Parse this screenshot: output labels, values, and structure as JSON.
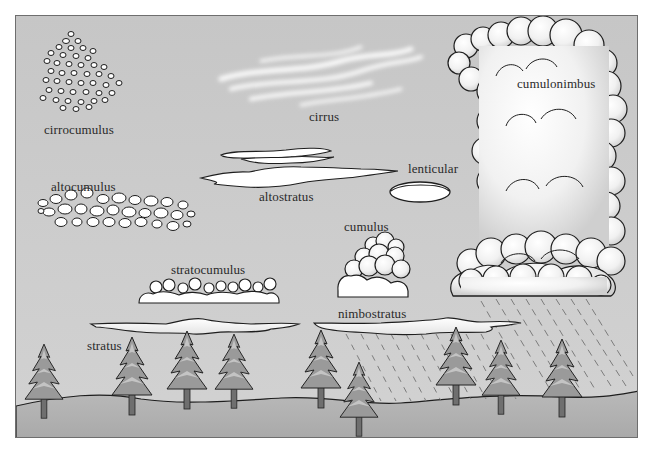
{
  "diagram": {
    "type": "cloud-types-illustration",
    "colors": {
      "sky": "#c9c9c9",
      "ground": "#b2b2b2",
      "cloud_fill": "#ffffff",
      "cloud_outline": "#1e1e1e",
      "cloud_shade": "#d8d8d8",
      "tree_fill": "#8e8e8e",
      "tree_light": "#b9b9b9",
      "rain": "#7a7a7a"
    },
    "labels": {
      "cirrocumulus": "cirrocumulus",
      "cirrus": "cirrus",
      "cumulonimbus": "cumulonimbus",
      "altocumulus": "altocumulus",
      "altostratus": "altostratus",
      "lenticular": "lenticular",
      "cumulus": "cumulus",
      "stratocumulus": "stratocumulus",
      "nimbostratus": "nimbostratus",
      "stratus": "stratus"
    },
    "tree_count": 11
  }
}
